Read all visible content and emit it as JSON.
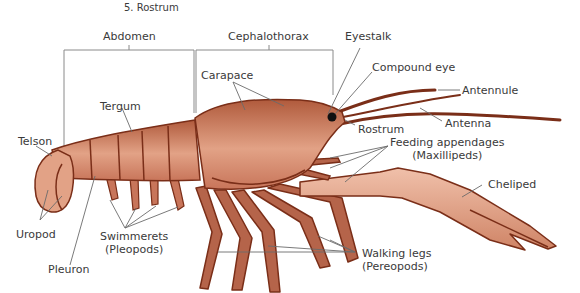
{
  "caption": "5.  Rostrum",
  "regions": {
    "abdomen": "Abdomen",
    "cephalothorax": "Cephalothorax"
  },
  "labels": {
    "eyestalk": "Eyestalk",
    "compound_eye": "Compound eye",
    "antennule": "Antennule",
    "antenna": "Antenna",
    "carapace": "Carapace",
    "rostrum": "Rostrum",
    "feeding_line1": "Feeding appendages",
    "feeding_line2": "(Maxillipeds)",
    "tergum": "Tergum",
    "telson": "Telson",
    "uropod": "Uropod",
    "pleuron": "Pleuron",
    "swimmerets_line1": "Swimmerets",
    "swimmerets_line2": "(Pleopods)",
    "walking_line1": "Walking legs",
    "walking_line2": "(Pereopods)",
    "cheliped": "Cheliped"
  },
  "colors": {
    "body_fill": "#c8755a",
    "body_light": "#ecb29a",
    "outline": "#7a2e18",
    "leader_line": "#6b6b6b",
    "text": "#3a3a3a"
  }
}
